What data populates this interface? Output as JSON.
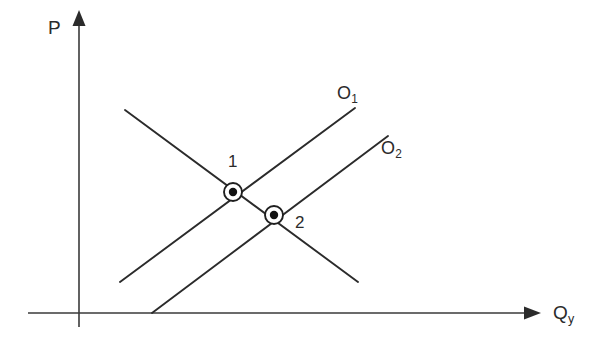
{
  "figure": {
    "kind": "supply-demand-diagram",
    "background_color": "#ffffff",
    "ink_color": "#2b2b2b",
    "width": 603,
    "height": 347
  },
  "axes": {
    "vertical": {
      "label_main": "P",
      "label_sub": "",
      "name": "price-axis",
      "x": 79,
      "y_top": 18,
      "y_bottom": 325,
      "arrow": "up"
    },
    "horizontal": {
      "label_main": "Q",
      "label_sub": "y",
      "name": "quantity-axis",
      "y": 313,
      "x_left": 28,
      "x_right": 530,
      "arrow": "right"
    }
  },
  "curves": [
    {
      "id": "demand",
      "label_main": "",
      "label_sub": "",
      "slope": "downward",
      "x1": 125,
      "y1": 110,
      "x2": 358,
      "y2": 282
    },
    {
      "id": "supply-1",
      "label_main": "O",
      "label_sub": "1",
      "slope": "upward",
      "x1": 120,
      "y1": 282,
      "x2": 355,
      "y2": 108
    },
    {
      "id": "supply-2",
      "label_main": "O",
      "label_sub": "2",
      "slope": "upward",
      "x1": 152,
      "y1": 313,
      "x2": 388,
      "y2": 136
    }
  ],
  "points": [
    {
      "id": "equilibrium-1",
      "label": "1",
      "x": 233,
      "y": 192
    },
    {
      "id": "equilibrium-2",
      "label": "2",
      "x": 274,
      "y": 215
    }
  ],
  "chart_data": {
    "type": "line",
    "title": "",
    "xlabel": "Q_y",
    "ylabel": "P",
    "grid": false,
    "legend": "inline-curve-labels",
    "axis_arrows": true,
    "series": [
      {
        "name": "Demand",
        "display_label": "",
        "direction": "downward-sloping",
        "points_px": [
          [
            125,
            110
          ],
          [
            358,
            282
          ]
        ]
      },
      {
        "name": "O1",
        "display_label": "O₁",
        "direction": "upward-sloping",
        "points_px": [
          [
            120,
            282
          ],
          [
            355,
            108
          ]
        ]
      },
      {
        "name": "O2",
        "display_label": "O₂",
        "direction": "upward-sloping",
        "points_px": [
          [
            152,
            313
          ],
          [
            388,
            136
          ]
        ]
      }
    ],
    "annotations": [
      {
        "text": "1",
        "at_px": [
          233,
          192
        ],
        "note": "equilibrium of demand with O1"
      },
      {
        "text": "2",
        "at_px": [
          274,
          215
        ],
        "note": "equilibrium of demand with O2"
      },
      {
        "text": "O₁",
        "at_px": [
          345,
          95
        ]
      },
      {
        "text": "O₂",
        "at_px": [
          390,
          150
        ]
      },
      {
        "text": "P",
        "at_px": [
          55,
          28
        ]
      },
      {
        "text": "Qᵧ",
        "at_px": [
          560,
          313
        ]
      }
    ]
  }
}
